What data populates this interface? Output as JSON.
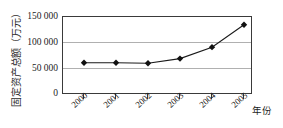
{
  "chart_data": {
    "type": "line",
    "title": "",
    "xlabel": "年份",
    "ylabel": "固定资产总额（万元）",
    "categories": [
      "2000",
      "2001",
      "2002",
      "2003",
      "2004",
      "2005"
    ],
    "values": [
      62000,
      62000,
      61000,
      70000,
      92000,
      135000
    ],
    "series": [
      {
        "name": "固定资产总额",
        "values": [
          62000,
          62000,
          61000,
          70000,
          92000,
          135000
        ]
      }
    ],
    "ylim": [
      0,
      150000
    ],
    "ytick_labels": [
      "150 000",
      "100 000",
      "50 000",
      "0"
    ],
    "ytick_values": [
      150000,
      100000,
      50000,
      0
    ],
    "grid": true,
    "legend": "none",
    "marker": "diamond",
    "line_color": "#1a1a1a",
    "marker_color": "#111111",
    "grid_color": "#b0b0b0",
    "axis_color": "#3a3a3a",
    "background": "#ffffff"
  },
  "axes": {
    "y_title": "固定资产总额（万元）",
    "x_title": "年份"
  }
}
